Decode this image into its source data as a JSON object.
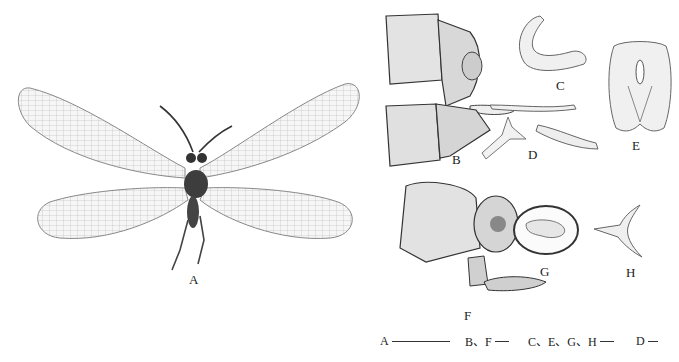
{
  "figure": {
    "panels": [
      {
        "id": "A",
        "label": "A",
        "description": "adult lacewing habitus, dorsal view"
      },
      {
        "id": "B",
        "label": "B",
        "description": "male terminalia, lateral view"
      },
      {
        "id": "C",
        "label": "C",
        "description": "genital structure, lateral view"
      },
      {
        "id": "D",
        "label": "D",
        "description": "genital structure, lateral view"
      },
      {
        "id": "E",
        "label": "E",
        "description": "genital structure, ventral view"
      },
      {
        "id": "F",
        "label": "F",
        "description": "female terminalia, lateral view"
      },
      {
        "id": "G",
        "label": "G",
        "description": "spermatheca"
      },
      {
        "id": "H",
        "label": "H",
        "description": "genital plate"
      }
    ],
    "scale_bars": [
      {
        "label": "A",
        "length_px": 58
      },
      {
        "label": "B、F",
        "length_px": 14
      },
      {
        "label": "C、E、G、H",
        "length_px": 14
      },
      {
        "label": "D",
        "length_px": 10
      }
    ],
    "colors": {
      "background": "#ffffff",
      "ink": "#222222",
      "wing": "#b8b8b8"
    }
  }
}
